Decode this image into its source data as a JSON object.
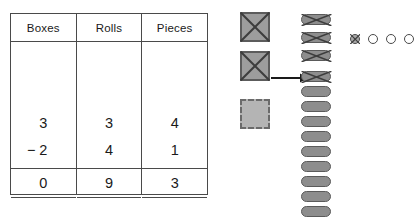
{
  "table": {
    "headers": [
      "Boxes",
      "Rolls",
      "Pieces"
    ],
    "minuend": [
      "3",
      "3",
      "4"
    ],
    "subtrahend": [
      "2",
      "4",
      "1"
    ],
    "operator": "−",
    "difference": [
      "0",
      "9",
      "3"
    ]
  },
  "manipulatives": {
    "boxes": {
      "label": "boxes-group",
      "crossed_out": 2,
      "regrouped_dashed": 1,
      "icon": "square-crossed-out-icon"
    },
    "rolls": {
      "label": "rolls-group",
      "crossed_out_top": 3,
      "crossed_out_after_regroup": 1,
      "remaining": 9,
      "icon": "roll-pill-icon"
    },
    "pieces": {
      "label": "pieces-group",
      "crossed_out": 1,
      "remaining": 3,
      "icon": "circle-piece-icon"
    },
    "arrow": {
      "name": "regroup-arrow-icon",
      "direction": "right"
    }
  },
  "colors": {
    "box_fill": "#9d9d9d",
    "box_stroke": "#5c5c5c",
    "box_dashed_fill": "#b4b4b4",
    "roll_fill": "#8d8d8d",
    "roll_stroke": "#5a5a5a",
    "piece_stroke": "#4a4a4a",
    "table_border": "#4a4a4a",
    "text": "#1a1a1a"
  }
}
